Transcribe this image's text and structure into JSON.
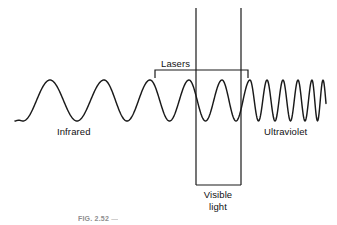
{
  "figure": {
    "type": "electromagnetic-spectrum-wave-diagram",
    "caption_label": "FIG. 2.52",
    "caption_rest": "—",
    "background_color": "#ffffff",
    "stroke_color": "#1a1a1a"
  },
  "labels": {
    "infrared": "Infrared",
    "ultraviolet": "Ultraviolet",
    "lasers": "Lasers",
    "visible_line1": "Visible",
    "visible_line2": "light"
  },
  "chart_data": {
    "type": "line",
    "title": "",
    "xlabel": "",
    "ylabel": "",
    "baseline_y": 122,
    "peak_y": 80,
    "trough_y": 121,
    "wave_start_x": 15,
    "wave_end_x": 326,
    "amplitude": 21,
    "cycle_peaks_x": [
      50,
      104,
      150,
      189,
      222,
      250,
      267,
      283,
      298,
      312,
      323
    ],
    "regions": [
      {
        "name": "Infrared",
        "x_start": 15,
        "x_end": 168,
        "label_x": 57,
        "label_y": 126
      },
      {
        "name": "Lasers",
        "x_start": 155,
        "x_end": 248,
        "bracket_y": 70,
        "tick_drop": 8,
        "label_x": 161,
        "label_y": 58
      },
      {
        "name": "Visible light",
        "x_start": 196,
        "x_end": 241,
        "box_top_y": 8,
        "box_bottom_y": 185,
        "label_x": 196,
        "label_y": 189
      },
      {
        "name": "Ultraviolet",
        "x_start": 248,
        "x_end": 326,
        "label_x": 264,
        "label_y": 126
      }
    ]
  },
  "geometry": {
    "lasers_bracket": {
      "left_x": 155,
      "right_x": 248,
      "top_y": 70,
      "tick_bottom_y": 78
    },
    "visible_box": {
      "left_x": 196,
      "right_x": 241,
      "top_y": 8,
      "bottom_y": 185
    }
  }
}
